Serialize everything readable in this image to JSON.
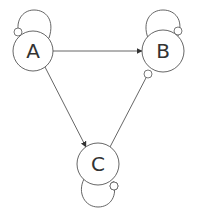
{
  "diagram": {
    "type": "state-graph",
    "stroke_color": "#555555",
    "background": "#ffffff",
    "nodes": [
      {
        "id": "A",
        "label": "A",
        "cx": 33,
        "cy": 51,
        "r": 20,
        "self_loop": true
      },
      {
        "id": "B",
        "label": "B",
        "cx": 163,
        "cy": 51,
        "r": 21,
        "self_loop": true
      },
      {
        "id": "C",
        "label": "C",
        "cx": 98,
        "cy": 164,
        "r": 21,
        "self_loop": true
      }
    ],
    "edges": [
      {
        "from": "A",
        "to": "B",
        "arrow": true
      },
      {
        "from": "A",
        "to": "C",
        "arrow": true
      },
      {
        "from": "B",
        "to": "C",
        "arrow": false,
        "tail_marker": true
      },
      {
        "from": "A",
        "to": "A",
        "loop": true,
        "marker": true
      },
      {
        "from": "B",
        "to": "B",
        "loop": true,
        "marker": true
      },
      {
        "from": "C",
        "to": "C",
        "loop": true,
        "marker": true
      }
    ]
  }
}
